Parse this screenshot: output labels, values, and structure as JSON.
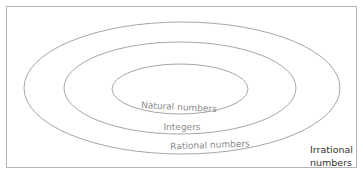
{
  "diagram": {
    "type": "nested-sets",
    "sets": [
      {
        "label": "Natural numbers",
        "level": "innermost"
      },
      {
        "label": "Integers",
        "level": "middle"
      },
      {
        "label": "Rational numbers",
        "level": "outer"
      }
    ],
    "outside_label_line1": "Irrational",
    "outside_label_line2": "numbers",
    "colors": {
      "stroke": "#8a8a8a",
      "border": "#b5b5b5",
      "label": "#8a8a8a",
      "outside_label": "#333333"
    }
  }
}
